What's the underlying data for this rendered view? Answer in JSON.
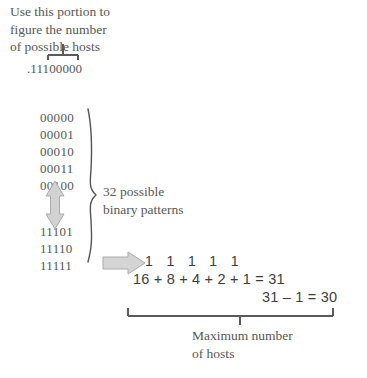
{
  "figure": {
    "header_note": "Use this portion to\nfigure the number\nof possible hosts",
    "octet_label": ".11100000",
    "binary_top": "00000\n00001\n00010\n00011\n00100",
    "binary_bottom": "11101\n11110\n11111",
    "brace_caption": "32 possible\nbinary patterns",
    "bits_row": "1   1   1   1   1",
    "sum_row": "16 + 8 + 4 + 2 + 1 = 31",
    "subtract_row": "31 – 1 = 30",
    "bottom_caption": "Maximum number\nof hosts"
  },
  "colors": {
    "text": "#575757",
    "math_text": "#3d3d3d",
    "rule": "#5a5a5a",
    "arrow_fill": "#d2d2d2",
    "arrow_stroke": "#a8a8a8"
  }
}
